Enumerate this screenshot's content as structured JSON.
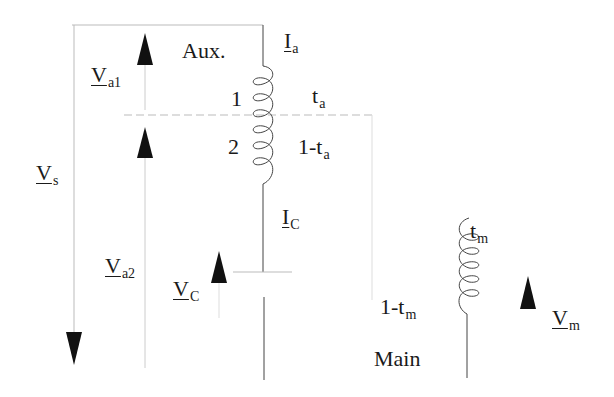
{
  "diagram": {
    "labels": {
      "aux": "Aux.",
      "main": "Main",
      "tap1": "1",
      "tap2": "2",
      "Ia": {
        "sym": "I",
        "sub": "a"
      },
      "Ic": {
        "sym": "I",
        "sub": "C"
      },
      "Va1": {
        "sym": "V",
        "sub": "a1"
      },
      "Va2": {
        "sym": "V",
        "sub": "a2"
      },
      "Vs": {
        "sym": "V",
        "sub": "s"
      },
      "Vc": {
        "sym": "V",
        "sub": "C"
      },
      "Vm": {
        "sym": "V",
        "sub": "m"
      },
      "ta": {
        "sym": "t",
        "sub": "a"
      },
      "one_minus_ta": {
        "pre": "1-t",
        "sub": "a"
      },
      "tm": {
        "sym": "t",
        "sub": "m"
      },
      "one_minus_tm": {
        "pre": "1-t",
        "sub": "m"
      }
    },
    "colors": {
      "line": "#444444",
      "light_line": "#bbbbbb",
      "arrow": "#111111"
    }
  }
}
